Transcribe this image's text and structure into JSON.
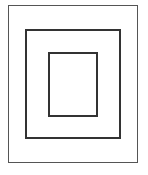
{
  "diagram": {
    "shapes": [
      {
        "name": "outer-rectangle",
        "stroke": "#555555"
      },
      {
        "name": "middle-rectangle",
        "stroke": "#333333"
      },
      {
        "name": "inner-rectangle",
        "stroke": "#333333"
      }
    ]
  }
}
